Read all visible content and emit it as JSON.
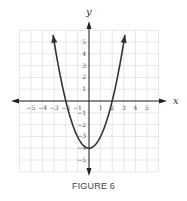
{
  "caption": "FIGURE 6",
  "chart_data": {
    "type": "line",
    "title": "",
    "equation_shape": "parabola opening upward, vertex (0,-4), x-intercepts (-2,0) and (2,0)",
    "xlabel": "x",
    "ylabel": "y",
    "xlim": [
      -6,
      6
    ],
    "ylim": [
      -6,
      6
    ],
    "grid": true,
    "x_ticks": [
      -5,
      -4,
      -3,
      -2,
      -1,
      1,
      2,
      3,
      4,
      5
    ],
    "x_tick_labels": [
      "−5",
      "−4",
      "−3",
      "−2",
      "−1",
      "1",
      "2",
      "3",
      "4",
      "5"
    ],
    "y_ticks": [
      5,
      4,
      3,
      2,
      1,
      -1,
      -2,
      -3,
      -4,
      -5
    ],
    "y_tick_labels": [
      "5",
      "4",
      "3",
      "2",
      "1",
      "−1",
      "−2",
      "−3",
      "−4",
      "−5"
    ],
    "series": [
      {
        "name": "y = x² − 4",
        "x": [
          -3.1,
          -3,
          -2.5,
          -2,
          -1.5,
          -1,
          -0.5,
          0,
          0.5,
          1,
          1.5,
          2,
          2.5,
          3,
          3.1
        ],
        "y": [
          5.61,
          5,
          2.25,
          0,
          -1.75,
          -3,
          -3.75,
          -4,
          -3.75,
          -3,
          -1.75,
          0,
          2.25,
          5,
          5.61
        ]
      }
    ]
  },
  "colors": {
    "grid": "#dcdcdc",
    "axes": "#222222",
    "curve": "#333333",
    "text": "#444444"
  }
}
